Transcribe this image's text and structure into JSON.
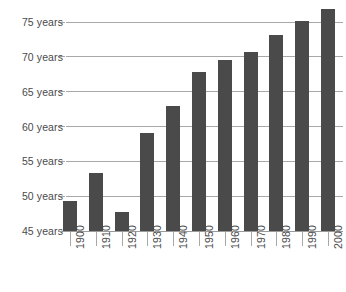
{
  "chart_data": {
    "type": "bar",
    "title": "",
    "subtitle": "",
    "xlabel": "",
    "ylabel": "",
    "categories": [
      "1900",
      "1910",
      "1920",
      "1930",
      "1940",
      "1950",
      "1960",
      "1970",
      "1980",
      "1990",
      "2000"
    ],
    "values": [
      49.3,
      53.3,
      47.7,
      59.1,
      62.9,
      67.8,
      69.5,
      70.7,
      73.1,
      75.2,
      76.8
    ],
    "value_unit": "years",
    "ylim": [
      45,
      77
    ],
    "ytick_values": [
      45,
      50,
      55,
      60,
      65,
      70,
      75
    ],
    "ytick_labels": [
      "45 years",
      "50 years",
      "55 years",
      "60 years",
      "65 years",
      "70 years",
      "75 years"
    ],
    "xtick_labels": [
      "1900",
      "1910",
      "1920",
      "1930",
      "1940",
      "1950",
      "1960",
      "1970",
      "1980",
      "1990",
      "2000"
    ],
    "grid": true,
    "grid_axis": "y",
    "legend": false,
    "legend_position": "none",
    "bar_color": "#4a4a4a",
    "grid_color": "#a8a8a8",
    "text_color": "#4a4a4a",
    "background_color": "#ffffff",
    "xtick_label_rotation": -90
  }
}
